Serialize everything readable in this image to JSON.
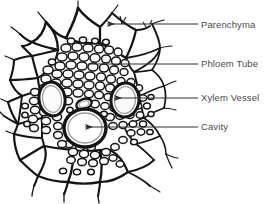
{
  "figure": {
    "kind": "botanical-cross-section-diagram",
    "background_color": "#ffffff",
    "ink_color": "#1a1a1a",
    "label_color": "#4a4a4a",
    "leader_color": "#3a3a3a"
  },
  "labels": [
    {
      "id": "parenchyma",
      "text": "Parenchyma",
      "leader": {
        "x1": 200,
        "y1": 24,
        "x2": 106,
        "y2": 24,
        "arrow": true
      },
      "target": "outer large thick-walled parenchyma cells"
    },
    {
      "id": "phloem_tube",
      "text": "Phloem Tube",
      "leader": {
        "x1": 200,
        "y1": 64,
        "x2": 88,
        "y2": 64,
        "arrow": false
      },
      "target": "dense mass of small thin-walled phloem cells"
    },
    {
      "id": "xylem_vessel",
      "text": "Xylem Vessel",
      "leader": {
        "x1": 200,
        "y1": 98,
        "x2": 113,
        "y2": 98,
        "arrow": true
      },
      "target": "large oval xylem vessel, right of centre"
    },
    {
      "id": "cavity",
      "text": "Cavity",
      "leader": {
        "x1": 200,
        "y1": 127,
        "x2": 84,
        "y2": 127,
        "arrow": true
      },
      "target": "large oval cavity, lower centre"
    }
  ],
  "structures": {
    "xylem_vessels": [
      {
        "id": "vessel-left",
        "cx": 52,
        "cy": 99,
        "rx": 13,
        "ry": 17,
        "rotation": -8
      },
      {
        "id": "vessel-right",
        "cx": 125,
        "cy": 100,
        "rx": 14,
        "ry": 17,
        "rotation": 6
      },
      {
        "id": "cavity-lower",
        "cx": 85,
        "cy": 128,
        "rx": 21,
        "ry": 19,
        "rotation": 0
      },
      {
        "id": "vessel-small",
        "cx": 84,
        "cy": 104,
        "rx": 8,
        "ry": 5,
        "rotation": -20
      }
    ]
  }
}
